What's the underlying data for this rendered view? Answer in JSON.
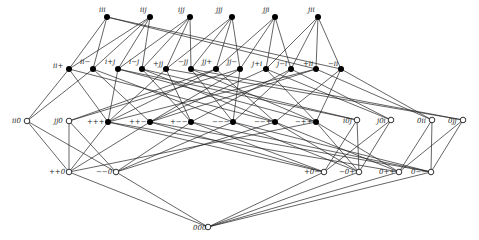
{
  "diagram": {
    "type": "hasse-diagram",
    "nodes": [
      {
        "id": "iii",
        "label": "iii",
        "x": 107,
        "y": 17,
        "filled": true,
        "lx": -8,
        "ly": -5
      },
      {
        "id": "iij",
        "label": "iij",
        "x": 150,
        "y": 17,
        "filled": true,
        "lx": -10,
        "ly": -5
      },
      {
        "id": "ijj",
        "label": "ijj",
        "x": 190,
        "y": 17,
        "filled": true,
        "lx": -12,
        "ly": -5
      },
      {
        "id": "jjj",
        "label": "jjj",
        "x": 232,
        "y": 17,
        "filled": true,
        "lx": -16,
        "ly": -5
      },
      {
        "id": "jji",
        "label": "jji",
        "x": 275,
        "y": 17,
        "filled": true,
        "lx": -12,
        "ly": -5
      },
      {
        "id": "jii",
        "label": "jii",
        "x": 318,
        "y": 17,
        "filled": true,
        "lx": -10,
        "ly": -5
      },
      {
        "id": "ii+",
        "label": "ii+",
        "x": 69,
        "y": 69,
        "filled": true,
        "lx": -16,
        "ly": -1
      },
      {
        "id": "ii-",
        "label": "ii−",
        "x": 93,
        "y": 69,
        "filled": true,
        "lx": -13,
        "ly": -5
      },
      {
        "id": "i+j",
        "label": "i+j",
        "x": 118,
        "y": 69,
        "filled": true,
        "lx": -13,
        "ly": -5
      },
      {
        "id": "i-j",
        "label": "i−j",
        "x": 142,
        "y": 69,
        "filled": true,
        "lx": -13,
        "ly": -5
      },
      {
        "id": "+jj",
        "label": "+jj",
        "x": 166,
        "y": 69,
        "filled": true,
        "lx": -13,
        "ly": -3
      },
      {
        "id": "-jj",
        "label": "−jj",
        "x": 191,
        "y": 69,
        "filled": true,
        "lx": -13,
        "ly": -5
      },
      {
        "id": "jj+",
        "label": "jj+",
        "x": 216,
        "y": 69,
        "filled": true,
        "lx": -14,
        "ly": -5
      },
      {
        "id": "jj-",
        "label": "jj−",
        "x": 240,
        "y": 69,
        "filled": true,
        "lx": -13,
        "ly": -5
      },
      {
        "id": "j+i",
        "label": "j+i",
        "x": 266,
        "y": 69,
        "filled": true,
        "lx": -14,
        "ly": -3
      },
      {
        "id": "j-i",
        "label": "j−i",
        "x": 291,
        "y": 69,
        "filled": true,
        "lx": -14,
        "ly": -3
      },
      {
        "id": "+ii",
        "label": "+ii",
        "x": 316,
        "y": 69,
        "filled": true,
        "lx": -13,
        "ly": -3
      },
      {
        "id": "-ii",
        "label": "−ii",
        "x": 341,
        "y": 69,
        "filled": true,
        "lx": -13,
        "ly": -3
      },
      {
        "id": "ii0",
        "label": "ii0",
        "x": 27,
        "y": 121,
        "filled": false,
        "lx": -15,
        "ly": 2
      },
      {
        "id": "jj0",
        "label": "jj0",
        "x": 69,
        "y": 121,
        "filled": false,
        "lx": -15,
        "ly": 2
      },
      {
        "id": "+++",
        "label": "+++",
        "x": 108,
        "y": 122,
        "filled": true,
        "lx": -21,
        "ly": 2
      },
      {
        "id": "++-",
        "label": "++−",
        "x": 150,
        "y": 122,
        "filled": true,
        "lx": -21,
        "ly": 2
      },
      {
        "id": "+--",
        "label": "+−−",
        "x": 191,
        "y": 122,
        "filled": true,
        "lx": -21,
        "ly": 2
      },
      {
        "id": "---",
        "label": "−−−",
        "x": 233,
        "y": 122,
        "filled": true,
        "lx": -21,
        "ly": 2
      },
      {
        "id": "--+",
        "label": "−−+",
        "x": 275,
        "y": 122,
        "filled": true,
        "lx": -21,
        "ly": 2
      },
      {
        "id": "-++",
        "label": "−++",
        "x": 316,
        "y": 122,
        "filled": true,
        "lx": -21,
        "ly": 2
      },
      {
        "id": "i0j",
        "label": "i0j",
        "x": 357,
        "y": 120,
        "filled": false,
        "lx": -14,
        "ly": 3
      },
      {
        "id": "j0i",
        "label": "j0i",
        "x": 391,
        "y": 120,
        "filled": false,
        "lx": -14,
        "ly": 3
      },
      {
        "id": "0ii",
        "label": "0ii",
        "x": 432,
        "y": 120,
        "filled": false,
        "lx": -15,
        "ly": 3
      },
      {
        "id": "0jj",
        "label": "0jj",
        "x": 463,
        "y": 120,
        "filled": false,
        "lx": -15,
        "ly": 3
      },
      {
        "id": "++0",
        "label": "++0",
        "x": 69,
        "y": 172,
        "filled": false,
        "lx": -20,
        "ly": 2
      },
      {
        "id": "--0",
        "label": "−−0",
        "x": 116,
        "y": 172,
        "filled": false,
        "lx": -20,
        "ly": 2
      },
      {
        "id": "+0-",
        "label": "+0−",
        "x": 324,
        "y": 172,
        "filled": false,
        "lx": -20,
        "ly": 2
      },
      {
        "id": "-0+",
        "label": "−0+",
        "x": 359,
        "y": 172,
        "filled": false,
        "lx": -20,
        "ly": 2
      },
      {
        "id": "0++",
        "label": "0++",
        "x": 399,
        "y": 172,
        "filled": false,
        "lx": -20,
        "ly": 2
      },
      {
        "id": "0--",
        "label": "0−−",
        "x": 431,
        "y": 172,
        "filled": false,
        "lx": -20,
        "ly": 2
      },
      {
        "id": "000",
        "label": "000",
        "x": 208,
        "y": 227,
        "filled": false,
        "lx": -15,
        "ly": 3
      }
    ],
    "edges": [
      [
        "iii",
        "ii+"
      ],
      [
        "iii",
        "ii-"
      ],
      [
        "iii",
        "+ii"
      ],
      [
        "iii",
        "-ii"
      ],
      [
        "iij",
        "ii+"
      ],
      [
        "iij",
        "ii-"
      ],
      [
        "iij",
        "i+j"
      ],
      [
        "iij",
        "i-j"
      ],
      [
        "ijj",
        "i+j"
      ],
      [
        "ijj",
        "i-j"
      ],
      [
        "ijj",
        "+jj"
      ],
      [
        "ijj",
        "-jj"
      ],
      [
        "jjj",
        "+jj"
      ],
      [
        "jjj",
        "-jj"
      ],
      [
        "jjj",
        "jj+"
      ],
      [
        "jjj",
        "jj-"
      ],
      [
        "jji",
        "jj+"
      ],
      [
        "jji",
        "jj-"
      ],
      [
        "jji",
        "j+i"
      ],
      [
        "jji",
        "j-i"
      ],
      [
        "jii",
        "j+i"
      ],
      [
        "jii",
        "j-i"
      ],
      [
        "jii",
        "+ii"
      ],
      [
        "jii",
        "-ii"
      ],
      [
        "ii+",
        "ii0"
      ],
      [
        "ii+",
        "+++"
      ],
      [
        "ii+",
        "--+"
      ],
      [
        "ii-",
        "ii0"
      ],
      [
        "ii-",
        "++-"
      ],
      [
        "ii-",
        "---"
      ],
      [
        "i+j",
        "i0j"
      ],
      [
        "i+j",
        "+++"
      ],
      [
        "i+j",
        "-++"
      ],
      [
        "i-j",
        "i0j"
      ],
      [
        "i-j",
        "+--"
      ],
      [
        "i-j",
        "--+"
      ],
      [
        "+jj",
        "0jj"
      ],
      [
        "+jj",
        "+++"
      ],
      [
        "+jj",
        "+--"
      ],
      [
        "-jj",
        "0jj"
      ],
      [
        "-jj",
        "-++"
      ],
      [
        "-jj",
        "---"
      ],
      [
        "jj+",
        "jj0"
      ],
      [
        "jj+",
        "+++"
      ],
      [
        "jj+",
        "--+"
      ],
      [
        "jj-",
        "jj0"
      ],
      [
        "jj-",
        "++-"
      ],
      [
        "jj-",
        "---"
      ],
      [
        "j+i",
        "j0i"
      ],
      [
        "j+i",
        "++-"
      ],
      [
        "j+i",
        "-++"
      ],
      [
        "j-i",
        "j0i"
      ],
      [
        "j-i",
        "+--"
      ],
      [
        "j-i",
        "---"
      ],
      [
        "+ii",
        "0ii"
      ],
      [
        "+ii",
        "+++"
      ],
      [
        "+ii",
        "++-"
      ],
      [
        "-ii",
        "0ii"
      ],
      [
        "-ii",
        "-++"
      ],
      [
        "-ii",
        "--+"
      ],
      [
        "ii0",
        "++0"
      ],
      [
        "ii0",
        "--0"
      ],
      [
        "jj0",
        "++0"
      ],
      [
        "jj0",
        "--0"
      ],
      [
        "+++",
        "++0"
      ],
      [
        "+++",
        "0++"
      ],
      [
        "+++",
        "+0-"
      ],
      [
        "++-",
        "++0"
      ],
      [
        "++-",
        "+0-"
      ],
      [
        "++-",
        "0--"
      ],
      [
        "+--",
        "+0-"
      ],
      [
        "+--",
        "0--"
      ],
      [
        "+--",
        "--0"
      ],
      [
        "---",
        "--0"
      ],
      [
        "---",
        "0--"
      ],
      [
        "---",
        "-0+"
      ],
      [
        "--+",
        "--0"
      ],
      [
        "--+",
        "-0+"
      ],
      [
        "--+",
        "0++"
      ],
      [
        "-++",
        "-0+"
      ],
      [
        "-++",
        "0++"
      ],
      [
        "-++",
        "++0"
      ],
      [
        "i0j",
        "+0-"
      ],
      [
        "i0j",
        "-0+"
      ],
      [
        "j0i",
        "+0-"
      ],
      [
        "j0i",
        "-0+"
      ],
      [
        "0ii",
        "0++"
      ],
      [
        "0ii",
        "0--"
      ],
      [
        "0jj",
        "0++"
      ],
      [
        "0jj",
        "0--"
      ],
      [
        "++0",
        "000"
      ],
      [
        "--0",
        "000"
      ],
      [
        "+0-",
        "000"
      ],
      [
        "-0+",
        "000"
      ],
      [
        "0++",
        "000"
      ],
      [
        "0--",
        "000"
      ]
    ]
  }
}
